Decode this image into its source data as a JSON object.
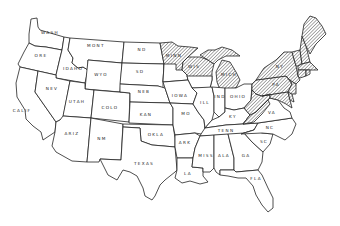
{
  "map": {
    "title": "",
    "hatch_color": "#555555",
    "line_color": "#222222",
    "background": "#ffffff",
    "states": [
      {
        "id": "wa",
        "label": "WASH",
        "hatched": false
      },
      {
        "id": "or",
        "label": "ORE",
        "hatched": false
      },
      {
        "id": "ca",
        "label": "CALIF",
        "hatched": false
      },
      {
        "id": "id",
        "label": "IDAHO",
        "hatched": false
      },
      {
        "id": "nv",
        "label": "NEV",
        "hatched": false
      },
      {
        "id": "mt",
        "label": "MONT",
        "hatched": false
      },
      {
        "id": "wy",
        "label": "WYO",
        "hatched": false
      },
      {
        "id": "ut",
        "label": "UTAH",
        "hatched": false
      },
      {
        "id": "az",
        "label": "ARIZ",
        "hatched": false
      },
      {
        "id": "co",
        "label": "COLO",
        "hatched": false
      },
      {
        "id": "nm",
        "label": "NM",
        "hatched": false
      },
      {
        "id": "nd",
        "label": "ND",
        "hatched": false
      },
      {
        "id": "sd",
        "label": "SD",
        "hatched": false
      },
      {
        "id": "ne",
        "label": "NEB",
        "hatched": false
      },
      {
        "id": "ks",
        "label": "KAN",
        "hatched": false
      },
      {
        "id": "ok",
        "label": "OKLA",
        "hatched": false
      },
      {
        "id": "tx",
        "label": "TEXAS",
        "hatched": false
      },
      {
        "id": "mn",
        "label": "MINN",
        "hatched": "partial"
      },
      {
        "id": "ia",
        "label": "IOWA",
        "hatched": false
      },
      {
        "id": "mo",
        "label": "MO",
        "hatched": false
      },
      {
        "id": "ar",
        "label": "ARK",
        "hatched": false
      },
      {
        "id": "la",
        "label": "LA",
        "hatched": false
      },
      {
        "id": "wi",
        "label": "WIS",
        "hatched": "partial"
      },
      {
        "id": "il",
        "label": "ILL",
        "hatched": false
      },
      {
        "id": "mi",
        "label": "MICH",
        "hatched": true
      },
      {
        "id": "in",
        "label": "IND",
        "hatched": false
      },
      {
        "id": "oh",
        "label": "OHIO",
        "hatched": false
      },
      {
        "id": "ky",
        "label": "KY",
        "hatched": false
      },
      {
        "id": "tn",
        "label": "TENN",
        "hatched": false
      },
      {
        "id": "ms",
        "label": "MISS",
        "hatched": false
      },
      {
        "id": "al",
        "label": "ALA",
        "hatched": false
      },
      {
        "id": "ga",
        "label": "GA",
        "hatched": false
      },
      {
        "id": "fl",
        "label": "FLA",
        "hatched": false
      },
      {
        "id": "sc",
        "label": "SC",
        "hatched": false
      },
      {
        "id": "nc",
        "label": "NC",
        "hatched": false
      },
      {
        "id": "va",
        "label": "VA",
        "hatched": "partial"
      },
      {
        "id": "wv",
        "label": "W VA",
        "hatched": true
      },
      {
        "id": "pa",
        "label": "PA",
        "hatched": true
      },
      {
        "id": "ny",
        "label": "NY",
        "hatched": true
      },
      {
        "id": "vt",
        "label": "VT",
        "hatched": true
      },
      {
        "id": "nh",
        "label": "NH",
        "hatched": true
      },
      {
        "id": "me",
        "label": "MAINE",
        "hatched": true
      },
      {
        "id": "ma",
        "label": "MASS",
        "hatched": true
      },
      {
        "id": "ct",
        "label": "CONN",
        "hatched": true
      },
      {
        "id": "ri",
        "label": "RI",
        "hatched": true
      },
      {
        "id": "nj",
        "label": "NJ",
        "hatched": true
      },
      {
        "id": "de",
        "label": "DEL",
        "hatched": true
      },
      {
        "id": "md",
        "label": "MD",
        "hatched": true
      }
    ]
  }
}
